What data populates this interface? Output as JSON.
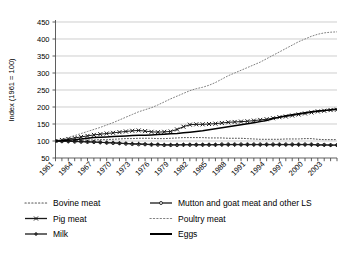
{
  "chart_data": {
    "type": "line",
    "title": "",
    "xlabel": "",
    "ylabel": "Index (1961 = 100)",
    "ylim": [
      50,
      450
    ],
    "yticks": [
      50,
      100,
      150,
      200,
      250,
      300,
      350,
      400,
      450
    ],
    "grid": true,
    "legend_position": "bottom",
    "legend_columns": 2,
    "x": [
      1961,
      1962,
      1963,
      1964,
      1965,
      1966,
      1967,
      1968,
      1969,
      1970,
      1971,
      1972,
      1973,
      1974,
      1975,
      1976,
      1977,
      1978,
      1979,
      1980,
      1981,
      1982,
      1983,
      1984,
      1985,
      1986,
      1987,
      1988,
      1989,
      1990,
      1991,
      1992,
      1993,
      1994,
      1995,
      1996,
      1997,
      1998,
      1999,
      2000,
      2001,
      2002,
      2003,
      2004,
      2005
    ],
    "xtick_labels": [
      "1961",
      "1964",
      "1967",
      "1970",
      "1973",
      "1976",
      "1979",
      "1982",
      "1985",
      "1988",
      "1991",
      "1994",
      "1997",
      "2000",
      "2003"
    ],
    "series": [
      {
        "name": "Bovine meat",
        "style": "dotted",
        "marker": "none",
        "color": "#555555",
        "values": [
          100,
          100,
          101,
          101,
          102,
          103,
          103,
          104,
          104,
          105,
          106,
          107,
          107,
          108,
          108,
          108,
          107,
          107,
          108,
          109,
          110,
          110,
          110,
          110,
          109,
          109,
          109,
          108,
          108,
          108,
          107,
          106,
          105,
          105,
          105,
          105,
          106,
          106,
          106,
          107,
          107,
          105,
          104,
          104,
          104
        ]
      },
      {
        "name": "Mutton and goat meat and other LS",
        "style": "solid",
        "marker": "circle",
        "color": "#1a1a1a",
        "values": [
          100,
          99,
          99,
          98,
          98,
          97,
          97,
          96,
          95,
          94,
          93,
          92,
          91,
          90,
          90,
          89,
          89,
          88,
          88,
          88,
          89,
          89,
          89,
          89,
          89,
          89,
          90,
          90,
          90,
          90,
          90,
          90,
          90,
          90,
          90,
          90,
          90,
          90,
          90,
          90,
          90,
          89,
          89,
          88,
          88
        ]
      },
      {
        "name": "Pig meat",
        "style": "solid",
        "marker": "x",
        "color": "#1a1a1a",
        "values": [
          100,
          103,
          106,
          109,
          112,
          115,
          118,
          120,
          122,
          124,
          126,
          128,
          130,
          131,
          129,
          127,
          126,
          127,
          128,
          134,
          142,
          148,
          149,
          149,
          150,
          151,
          153,
          155,
          156,
          157,
          158,
          160,
          162,
          164,
          167,
          170,
          172,
          175,
          178,
          181,
          184,
          187,
          189,
          191,
          192
        ]
      },
      {
        "name": "Poultry meat",
        "style": "dotted",
        "marker": "none",
        "color": "#808080",
        "values": [
          100,
          105,
          110,
          116,
          122,
          128,
          134,
          140,
          147,
          154,
          162,
          170,
          178,
          186,
          192,
          198,
          206,
          215,
          224,
          232,
          240,
          248,
          254,
          258,
          264,
          272,
          282,
          292,
          300,
          308,
          316,
          324,
          332,
          342,
          352,
          362,
          372,
          382,
          392,
          400,
          408,
          414,
          418,
          420,
          421
        ]
      },
      {
        "name": "Milk",
        "style": "solid",
        "marker": "plus",
        "color": "#1a1a1a",
        "values": [
          100,
          100,
          99,
          99,
          98,
          98,
          97,
          96,
          95,
          95,
          94,
          93,
          92,
          92,
          91,
          90,
          90,
          89,
          89,
          89,
          89,
          89,
          89,
          89,
          89,
          89,
          89,
          89,
          89,
          89,
          89,
          89,
          89,
          89,
          89,
          89,
          89,
          89,
          89,
          89,
          89,
          88,
          88,
          88,
          88
        ]
      },
      {
        "name": "Eggs",
        "style": "solid",
        "marker": "none",
        "color": "#000000",
        "values": [
          100,
          101,
          103,
          104,
          106,
          108,
          110,
          111,
          112,
          113,
          114,
          115,
          116,
          117,
          117,
          118,
          119,
          120,
          121,
          122,
          124,
          126,
          128,
          130,
          133,
          136,
          139,
          142,
          145,
          148,
          151,
          154,
          157,
          160,
          166,
          170,
          174,
          177,
          180,
          183,
          186,
          188,
          190,
          192,
          194
        ]
      }
    ]
  },
  "legend": {
    "items": [
      {
        "label": "Bovine meat",
        "key": "bovine-meat"
      },
      {
        "label": "Mutton and goat meat and other LS",
        "key": "mutton-goat-meat"
      },
      {
        "label": "Pig meat",
        "key": "pig-meat"
      },
      {
        "label": "Poultry meat",
        "key": "poultry-meat"
      },
      {
        "label": "Milk",
        "key": "milk"
      },
      {
        "label": "Eggs",
        "key": "eggs"
      }
    ]
  },
  "axis": {
    "y_title": "Index (1961 = 100)",
    "y_ticks": [
      "450",
      "400",
      "350",
      "300",
      "250",
      "200",
      "150",
      "100",
      "50"
    ],
    "x_ticks": [
      "1961",
      "1964",
      "1967",
      "1970",
      "1973",
      "1976",
      "1979",
      "1982",
      "1985",
      "1988",
      "1991",
      "1994",
      "1997",
      "2000",
      "2003"
    ]
  }
}
